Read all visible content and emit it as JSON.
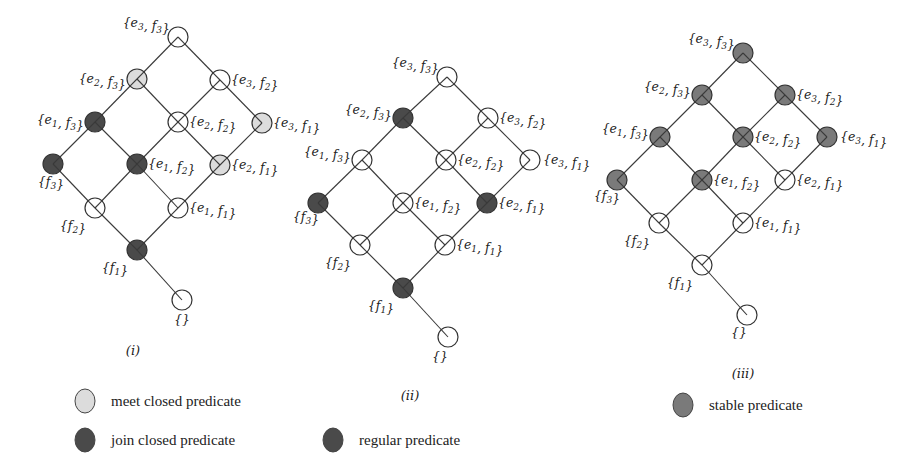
{
  "colors": {
    "open": "#ffffff",
    "meet": "#dcdcdc",
    "join": "#4a4a4a",
    "regular": "#4a4a4a",
    "stable": "#7a7a7a"
  },
  "diagrams": [
    {
      "caption": "(i)",
      "caption_pos": [
        133,
        355
      ],
      "nodes": [
        {
          "id": "e3f3",
          "label": "{e3, f3}",
          "x": 178,
          "y": 37,
          "fill": "open",
          "lx": -8,
          "ly": -10,
          "anchor": "end"
        },
        {
          "id": "e2f3",
          "label": "{e2, f3}",
          "x": 137,
          "y": 79,
          "fill": "meet",
          "lx": -11,
          "ly": 4,
          "anchor": "end"
        },
        {
          "id": "e3f2",
          "label": "{e3, f2}",
          "x": 220,
          "y": 80,
          "fill": "open",
          "lx": 11,
          "ly": 4,
          "anchor": "start"
        },
        {
          "id": "e1f3",
          "label": "{e1, f3}",
          "x": 95,
          "y": 122,
          "fill": "join",
          "lx": -11,
          "ly": 2,
          "anchor": "end"
        },
        {
          "id": "e2f2",
          "label": "{e2, f2}",
          "x": 178,
          "y": 122,
          "fill": "open",
          "lx": 11,
          "ly": 4,
          "anchor": "start"
        },
        {
          "id": "e3f1",
          "label": "{e3, f1}",
          "x": 262,
          "y": 123,
          "fill": "meet",
          "lx": 11,
          "ly": 4,
          "anchor": "start"
        },
        {
          "id": "f3",
          "label": "{f3}",
          "x": 53,
          "y": 164,
          "fill": "join",
          "lx": -2,
          "ly": 22,
          "anchor": "middle"
        },
        {
          "id": "e1f2",
          "label": "{e1, f2}",
          "x": 137,
          "y": 164,
          "fill": "join",
          "lx": 11,
          "ly": 4,
          "anchor": "start"
        },
        {
          "id": "e2f1",
          "label": "{e2, f1}",
          "x": 220,
          "y": 165,
          "fill": "meet",
          "lx": 11,
          "ly": 4,
          "anchor": "start"
        },
        {
          "id": "f2",
          "label": "{f2}",
          "x": 95,
          "y": 208,
          "fill": "open",
          "lx": -22,
          "ly": 22,
          "anchor": "middle"
        },
        {
          "id": "e1f1",
          "label": "{e1, f1}",
          "x": 178,
          "y": 208,
          "fill": "open",
          "lx": 11,
          "ly": 4,
          "anchor": "start"
        },
        {
          "id": "f1",
          "label": "{f1}",
          "x": 137,
          "y": 250,
          "fill": "join",
          "lx": -22,
          "ly": 22,
          "anchor": "middle"
        },
        {
          "id": "empty",
          "label": "{}",
          "x": 182,
          "y": 300,
          "fill": "open",
          "lx": 0,
          "ly": 24,
          "anchor": "middle"
        }
      ]
    },
    {
      "caption": "(ii)",
      "caption_pos": [
        410,
        400
      ],
      "nodes": [
        {
          "id": "e3f3",
          "label": "{e3, f3}",
          "x": 447,
          "y": 77,
          "fill": "open",
          "lx": -8,
          "ly": -10,
          "anchor": "end"
        },
        {
          "id": "e2f3",
          "label": "{e2, f3}",
          "x": 403,
          "y": 118,
          "fill": "regular",
          "lx": -11,
          "ly": -4,
          "anchor": "end"
        },
        {
          "id": "e3f2",
          "label": "{e3, f2}",
          "x": 488,
          "y": 118,
          "fill": "open",
          "lx": 11,
          "ly": 4,
          "anchor": "start"
        },
        {
          "id": "e1f3",
          "label": "{e1, f3}",
          "x": 362,
          "y": 160,
          "fill": "open",
          "lx": -11,
          "ly": -4,
          "anchor": "end"
        },
        {
          "id": "e2f2",
          "label": "{e2, f2}",
          "x": 446,
          "y": 160,
          "fill": "open",
          "lx": 11,
          "ly": 4,
          "anchor": "start"
        },
        {
          "id": "e3f1",
          "label": "{e3, f1}",
          "x": 530,
          "y": 160,
          "fill": "open",
          "lx": 13,
          "ly": 4,
          "anchor": "start"
        },
        {
          "id": "f3",
          "label": "{f3}",
          "x": 318,
          "y": 203,
          "fill": "regular",
          "lx": -12,
          "ly": 18,
          "anchor": "middle"
        },
        {
          "id": "e1f2",
          "label": "{e1, f2}",
          "x": 403,
          "y": 203,
          "fill": "open",
          "lx": 11,
          "ly": 4,
          "anchor": "start"
        },
        {
          "id": "e2f1",
          "label": "{e2, f1}",
          "x": 487,
          "y": 203,
          "fill": "regular",
          "lx": 11,
          "ly": 4,
          "anchor": "start"
        },
        {
          "id": "f2",
          "label": "{f2}",
          "x": 360,
          "y": 245,
          "fill": "open",
          "lx": -22,
          "ly": 22,
          "anchor": "middle"
        },
        {
          "id": "e1f1",
          "label": "{e1, f1}",
          "x": 445,
          "y": 245,
          "fill": "open",
          "lx": 11,
          "ly": 4,
          "anchor": "start"
        },
        {
          "id": "f1",
          "label": "{f1}",
          "x": 403,
          "y": 288,
          "fill": "regular",
          "lx": -22,
          "ly": 22,
          "anchor": "middle"
        },
        {
          "id": "empty",
          "label": "{}",
          "x": 448,
          "y": 337,
          "fill": "open",
          "lx": -8,
          "ly": 24,
          "anchor": "middle"
        }
      ]
    },
    {
      "caption": "(iii)",
      "caption_pos": [
        743,
        378
      ],
      "nodes": [
        {
          "id": "e3f3",
          "label": "{e3, f3}",
          "x": 743,
          "y": 53,
          "fill": "stable",
          "lx": -8,
          "ly": -10,
          "anchor": "end"
        },
        {
          "id": "e2f3",
          "label": "{e2, f3}",
          "x": 702,
          "y": 95,
          "fill": "stable",
          "lx": -11,
          "ly": -4,
          "anchor": "end"
        },
        {
          "id": "e3f2",
          "label": "{e3, f2}",
          "x": 785,
          "y": 95,
          "fill": "stable",
          "lx": 11,
          "ly": 4,
          "anchor": "start"
        },
        {
          "id": "e1f3",
          "label": "{e1, f3}",
          "x": 660,
          "y": 137,
          "fill": "stable",
          "lx": -11,
          "ly": -4,
          "anchor": "end"
        },
        {
          "id": "e2f2",
          "label": "{e2, f2}",
          "x": 743,
          "y": 137,
          "fill": "stable",
          "lx": 11,
          "ly": 4,
          "anchor": "start"
        },
        {
          "id": "e3f1",
          "label": "{e3, f1}",
          "x": 827,
          "y": 137,
          "fill": "stable",
          "lx": 13,
          "ly": 4,
          "anchor": "start"
        },
        {
          "id": "f3",
          "label": "{f3}",
          "x": 617,
          "y": 180,
          "fill": "stable",
          "lx": -10,
          "ly": 20,
          "anchor": "middle"
        },
        {
          "id": "e1f2",
          "label": "{e1, f2}",
          "x": 702,
          "y": 180,
          "fill": "stable",
          "lx": 11,
          "ly": 4,
          "anchor": "start"
        },
        {
          "id": "e2f1",
          "label": "{e2, f1}",
          "x": 785,
          "y": 180,
          "fill": "open",
          "lx": 11,
          "ly": 4,
          "anchor": "start"
        },
        {
          "id": "f2",
          "label": "{f2}",
          "x": 659,
          "y": 223,
          "fill": "open",
          "lx": -22,
          "ly": 22,
          "anchor": "middle"
        },
        {
          "id": "e1f1",
          "label": "{e1, f1}",
          "x": 743,
          "y": 223,
          "fill": "open",
          "lx": 11,
          "ly": 4,
          "anchor": "start"
        },
        {
          "id": "f1",
          "label": "{f1}",
          "x": 702,
          "y": 265,
          "fill": "open",
          "lx": -22,
          "ly": 22,
          "anchor": "middle"
        },
        {
          "id": "empty",
          "label": "{}",
          "x": 747,
          "y": 315,
          "fill": "open",
          "lx": -8,
          "ly": 22,
          "anchor": "middle"
        }
      ]
    }
  ],
  "edges": [
    [
      "e3f3",
      "e2f3"
    ],
    [
      "e3f3",
      "e3f2"
    ],
    [
      "e2f3",
      "e1f3"
    ],
    [
      "e2f3",
      "e2f2"
    ],
    [
      "e3f2",
      "e2f2"
    ],
    [
      "e3f2",
      "e3f1"
    ],
    [
      "e1f3",
      "f3"
    ],
    [
      "e1f3",
      "e1f2"
    ],
    [
      "e2f2",
      "e1f2"
    ],
    [
      "e2f2",
      "e2f1"
    ],
    [
      "e3f1",
      "e2f1"
    ],
    [
      "f3",
      "f2"
    ],
    [
      "e1f2",
      "f2"
    ],
    [
      "e1f2",
      "e1f1"
    ],
    [
      "e2f1",
      "e1f1"
    ],
    [
      "f2",
      "f1"
    ],
    [
      "e1f1",
      "f1"
    ],
    [
      "f1",
      "empty"
    ]
  ],
  "legend": [
    {
      "label": "meet closed predicate",
      "fill": "meet",
      "x": 85,
      "y": 401
    },
    {
      "label": "join closed predicate",
      "fill": "join",
      "x": 85,
      "y": 440
    },
    {
      "label": "regular predicate",
      "fill": "regular",
      "x": 333,
      "y": 440
    },
    {
      "label": "stable predicate",
      "fill": "stable",
      "x": 683,
      "y": 405
    }
  ]
}
